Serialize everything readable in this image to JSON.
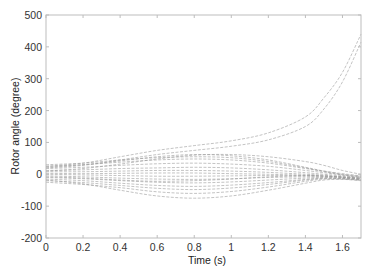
{
  "chart_data": {
    "type": "line",
    "title": "",
    "xlabel": "Time (s)",
    "ylabel": "Rotor angle (degree)",
    "xlim": [
      0,
      1.7
    ],
    "ylim": [
      -200,
      500
    ],
    "xticks": [
      0,
      0.2,
      0.4,
      0.6,
      0.8,
      1,
      1.2,
      1.4,
      1.6
    ],
    "xtick_labels": [
      "0",
      "0.2",
      "0.4",
      "0.6",
      "0.8",
      "1",
      "1.2",
      "1.4",
      "1.6"
    ],
    "yticks": [
      -200,
      -100,
      0,
      100,
      200,
      300,
      400,
      500
    ],
    "ytick_labels": [
      "-200",
      "-100",
      "0",
      "100",
      "200",
      "300",
      "400",
      "500"
    ],
    "grid": false,
    "legend": null,
    "line_color": "#9a9a9a",
    "x": [
      0,
      0.2,
      0.4,
      0.6,
      0.8,
      1.0,
      1.2,
      1.4,
      1.5,
      1.6,
      1.7
    ],
    "series": [
      {
        "name": "unstable-1",
        "values": [
          25,
          35,
          55,
          75,
          90,
          105,
          130,
          180,
          240,
          320,
          440
        ]
      },
      {
        "name": "unstable-2",
        "values": [
          20,
          28,
          45,
          62,
          75,
          88,
          108,
          150,
          205,
          290,
          415
        ]
      },
      {
        "name": "gen-3",
        "values": [
          30,
          35,
          45,
          52,
          55,
          52,
          40,
          20,
          8,
          -2,
          -10
        ]
      },
      {
        "name": "gen-4",
        "values": [
          25,
          30,
          38,
          45,
          48,
          45,
          35,
          18,
          10,
          2,
          -5
        ]
      },
      {
        "name": "gen-5",
        "values": [
          18,
          22,
          28,
          33,
          35,
          32,
          25,
          12,
          5,
          -2,
          -8
        ]
      },
      {
        "name": "gen-6",
        "values": [
          12,
          14,
          18,
          20,
          22,
          20,
          14,
          5,
          0,
          -5,
          -10
        ]
      },
      {
        "name": "gen-7",
        "values": [
          8,
          8,
          10,
          12,
          12,
          10,
          6,
          0,
          -3,
          -8,
          -12
        ]
      },
      {
        "name": "gen-8",
        "values": [
          3,
          2,
          3,
          4,
          4,
          2,
          0,
          -3,
          -5,
          -8,
          -12
        ]
      },
      {
        "name": "gen-9",
        "values": [
          0,
          -2,
          -4,
          -6,
          -6,
          -5,
          -4,
          -5,
          -6,
          -9,
          -14
        ]
      },
      {
        "name": "gen-10",
        "values": [
          -5,
          -8,
          -12,
          -15,
          -16,
          -14,
          -10,
          -8,
          -8,
          -10,
          -15
        ]
      },
      {
        "name": "gen-11",
        "values": [
          -10,
          -14,
          -20,
          -25,
          -27,
          -24,
          -18,
          -12,
          -10,
          -12,
          -16
        ]
      },
      {
        "name": "gen-12",
        "values": [
          -15,
          -20,
          -28,
          -35,
          -38,
          -34,
          -26,
          -16,
          -12,
          -13,
          -17
        ]
      },
      {
        "name": "gen-13",
        "values": [
          -20,
          -26,
          -35,
          -44,
          -48,
          -43,
          -32,
          -18,
          -13,
          -14,
          -18
        ]
      },
      {
        "name": "gen-14",
        "values": [
          -25,
          -32,
          -42,
          -55,
          -60,
          -54,
          -40,
          -22,
          -15,
          -15,
          -19
        ]
      },
      {
        "name": "gen-15",
        "values": [
          -18,
          -30,
          -50,
          -68,
          -75,
          -68,
          -50,
          -28,
          -18,
          -16,
          -20
        ]
      },
      {
        "name": "gen-16",
        "values": [
          22,
          30,
          42,
          55,
          62,
          58,
          45,
          22,
          10,
          0,
          -6
        ]
      },
      {
        "name": "gen-17",
        "values": [
          -8,
          -12,
          -18,
          -22,
          -20,
          -15,
          -8,
          -4,
          -6,
          -10,
          -16
        ]
      },
      {
        "name": "gen-18",
        "values": [
          10,
          18,
          32,
          48,
          60,
          62,
          55,
          40,
          28,
          12,
          0
        ]
      }
    ]
  }
}
